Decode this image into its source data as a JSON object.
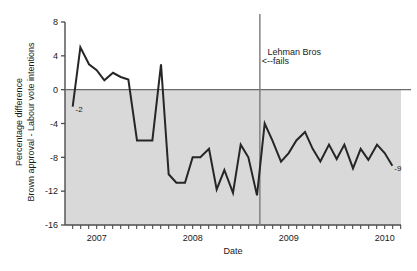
{
  "chart_data": {
    "type": "line",
    "title": "",
    "xlabel": "Date",
    "ylabel_line1": "Percentage difference",
    "ylabel_line2": "Brown approval - Labour vote intentions",
    "ylim": [
      -16,
      8
    ],
    "yticks": [
      8,
      4,
      0,
      -4,
      -8,
      -12,
      -16
    ],
    "ytick_labels": [
      "8",
      "4",
      "0",
      "-4",
      "-8",
      "-12",
      "-16"
    ],
    "xlim": [
      2006.67,
      2010.17
    ],
    "xticks": [
      2007,
      2008,
      2009,
      2010
    ],
    "xtick_labels": [
      "2007",
      "2008",
      "2009",
      "2010"
    ],
    "minor_xtick_interval_years": 0.0833,
    "grid": false,
    "legend": null,
    "zero_line": 0,
    "shaded_region": {
      "from": 0,
      "to": -16,
      "color": "#d9d9d9"
    },
    "line_color": "#262626",
    "line_width": 2,
    "annotations": [
      {
        "name": "lehman-line",
        "type": "vline",
        "x": 2008.7,
        "color": "#7a7a7a"
      },
      {
        "name": "lehman-text-1",
        "type": "text",
        "x": 2008.78,
        "y": 4.05,
        "text": "Lehman Bros"
      },
      {
        "name": "lehman-text-2",
        "type": "text",
        "x": 2008.72,
        "y": 3.0,
        "text": "<--fails"
      },
      {
        "name": "start-value-label",
        "type": "text",
        "x": 2006.78,
        "y": -2.6,
        "text": "-2"
      },
      {
        "name": "end-value-label",
        "type": "text",
        "x": 2010.1,
        "y": -9.6,
        "text": "-9"
      }
    ],
    "x": [
      2006.75,
      2006.83,
      2006.92,
      2007.0,
      2007.08,
      2007.17,
      2007.25,
      2007.33,
      2007.42,
      2007.5,
      2007.58,
      2007.67,
      2007.75,
      2007.83,
      2007.92,
      2008.0,
      2008.08,
      2008.17,
      2008.25,
      2008.33,
      2008.42,
      2008.5,
      2008.58,
      2008.67,
      2008.75,
      2008.83,
      2008.92,
      2009.0,
      2009.08,
      2009.17,
      2009.25,
      2009.33,
      2009.42,
      2009.5,
      2009.58,
      2009.67,
      2009.75,
      2009.83,
      2009.92,
      2010.0,
      2010.08
    ],
    "values": [
      -2,
      5,
      3,
      2.3,
      1.1,
      2,
      1.5,
      1.2,
      -6,
      -6,
      -6,
      3,
      -10,
      -11,
      -11,
      -8,
      -8,
      -7,
      -11.8,
      -9.5,
      -12.2,
      -6.5,
      -8,
      -12.5,
      -4,
      -6,
      -8.5,
      -7.5,
      -6,
      -5,
      -7,
      -8.5,
      -6.5,
      -8.2,
      -6.5,
      -9.3,
      -7,
      -8.3,
      -6.5,
      -7.5,
      -9
    ]
  },
  "axis": {
    "y_label_top": "Percentage difference",
    "y_label_bottom": "Brown approval - Labour vote intentions",
    "x_label": "Date"
  }
}
